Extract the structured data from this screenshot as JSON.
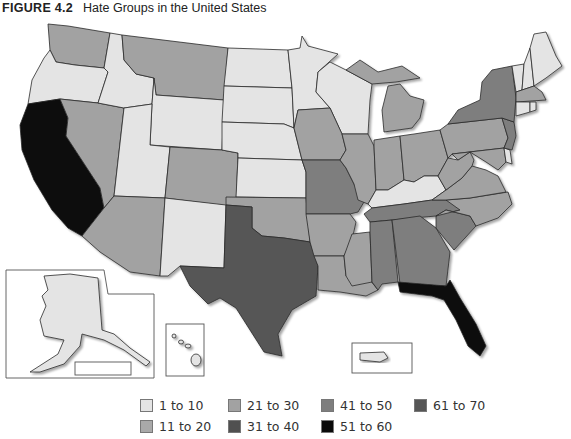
{
  "title": {
    "figure_label": "FIGURE 4.2",
    "text": "Hate Groups in the United States"
  },
  "legend": {
    "items": [
      {
        "label": "1 to 10",
        "color": "#e4e4e4"
      },
      {
        "label": "11 to 20",
        "color": "#a9a9a9"
      },
      {
        "label": "21 to 30",
        "color": "#a2a2a2"
      },
      {
        "label": "31 to 40",
        "color": "#505050"
      },
      {
        "label": "41 to 50",
        "color": "#7e7e7e"
      },
      {
        "label": "51 to 60",
        "color": "#0a0a0a"
      },
      {
        "label": "61 to 70",
        "color": "#565656"
      }
    ]
  },
  "map_data": {
    "type": "choropleth",
    "title": "Hate Groups in the United States",
    "bins": [
      "1 to 10",
      "11 to 20",
      "21 to 30",
      "31 to 40",
      "41 to 50",
      "51 to 60",
      "61 to 70"
    ],
    "states": {
      "WA": "21 to 30",
      "OR": "1 to 10",
      "CA": "51 to 60",
      "NV": "21 to 30",
      "ID": "1 to 10",
      "MT": "21 to 30",
      "WY": "1 to 10",
      "UT": "1 to 10",
      "AZ": "21 to 30",
      "CO": "21 to 30",
      "NM": "1 to 10",
      "ND": "1 to 10",
      "SD": "1 to 10",
      "NE": "1 to 10",
      "KS": "1 to 10",
      "OK": "21 to 30",
      "TX": "61 to 70",
      "MN": "1 to 10",
      "IA": "21 to 30",
      "MO": "41 to 50",
      "AR": "21 to 30",
      "LA": "21 to 30",
      "WI": "1 to 10",
      "IL": "21 to 30",
      "MI": "21 to 30",
      "IN": "21 to 30",
      "OH": "21 to 30",
      "KY": "1 to 10",
      "TN": "41 to 50",
      "MS": "21 to 30",
      "AL": "41 to 50",
      "GA": "41 to 50",
      "FL": "51 to 60",
      "SC": "41 to 50",
      "NC": "21 to 30",
      "VA": "21 to 30",
      "WV": "21 to 30",
      "PA": "21 to 30",
      "NY": "41 to 50",
      "NJ": "41 to 50",
      "DE": "1 to 10",
      "MD": "21 to 30",
      "CT": "1 to 10",
      "RI": "1 to 10",
      "MA": "21 to 30",
      "VT": "1 to 10",
      "NH": "1 to 10",
      "ME": "1 to 10",
      "AK": "1 to 10",
      "HI": "1 to 10",
      "PR": "1 to 10"
    }
  }
}
